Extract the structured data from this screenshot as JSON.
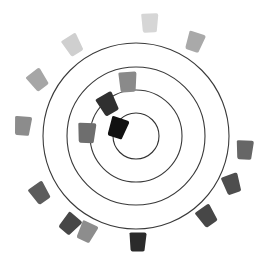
{
  "diagram": {
    "type": "radial-swatch-wheel",
    "background": "#ffffff",
    "center": [
      136,
      136
    ],
    "rings": [
      {
        "r": 23,
        "color": "#333333"
      },
      {
        "r": 46,
        "color": "#3a3a3a"
      },
      {
        "r": 69,
        "color": "#3a3a3a"
      },
      {
        "r": 93,
        "color": "#3a3a3a"
      }
    ],
    "outer_swatches": [
      {
        "name": "swatch-top",
        "cx": 150,
        "cy": 23,
        "rot": -2,
        "color": "#d6d6d6"
      },
      {
        "name": "swatch-top-right",
        "cx": 195,
        "cy": 42,
        "rot": 18,
        "color": "#a9a9a9"
      },
      {
        "name": "swatch-top-left",
        "cx": 73,
        "cy": 45,
        "rot": -32,
        "color": "#cfcfcf"
      },
      {
        "name": "swatch-upper-left",
        "cx": 38,
        "cy": 80,
        "rot": -38,
        "color": "#a6a6a6"
      },
      {
        "name": "swatch-left",
        "cx": 23,
        "cy": 126,
        "rot": 4,
        "color": "#8c8c8c"
      },
      {
        "name": "swatch-lower-left",
        "cx": 40,
        "cy": 193,
        "rot": -35,
        "color": "#5c5c5c"
      },
      {
        "name": "swatch-bottom-left-a",
        "cx": 70,
        "cy": 224,
        "rot": 40,
        "color": "#474747"
      },
      {
        "name": "swatch-bottom-left-b",
        "cx": 87,
        "cy": 232,
        "rot": 25,
        "color": "#8d8d8d"
      },
      {
        "name": "swatch-bottom",
        "cx": 138,
        "cy": 242,
        "rot": 0,
        "color": "#2b2b2b"
      },
      {
        "name": "swatch-bottom-right",
        "cx": 207,
        "cy": 216,
        "rot": -35,
        "color": "#474747"
      },
      {
        "name": "swatch-lower-right",
        "cx": 232,
        "cy": 184,
        "rot": -20,
        "color": "#4e4e4e"
      },
      {
        "name": "swatch-right",
        "cx": 245,
        "cy": 150,
        "rot": 2,
        "color": "#666666"
      }
    ],
    "inner_swatches": [
      {
        "name": "swatch-inner-upper",
        "cx": 128,
        "cy": 82,
        "rot": -4,
        "color": "#8a8a8a"
      },
      {
        "name": "swatch-inner-dark",
        "cx": 108,
        "cy": 104,
        "rot": -30,
        "color": "#303030"
      },
      {
        "name": "swatch-inner-left",
        "cx": 87,
        "cy": 133,
        "rot": 2,
        "color": "#6e6e6e"
      },
      {
        "name": "swatch-inner-black",
        "cx": 118,
        "cy": 128,
        "rot": 18,
        "color": "#111111"
      }
    ]
  }
}
